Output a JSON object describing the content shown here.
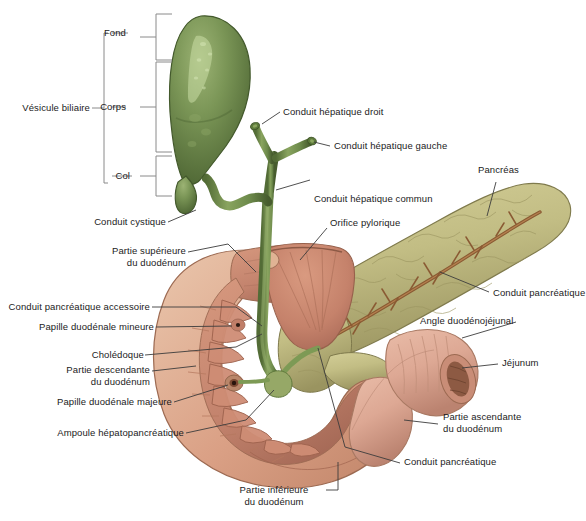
{
  "figure": {
    "language": "fr",
    "background_color": "#ffffff",
    "leader_line_color": "#3c3c3c",
    "bracket_color": "#8a8a8a",
    "text_color": "#1b1b1b"
  },
  "palette": {
    "gallbladder_green": "#6f8b4e",
    "gallbladder_green_dark": "#4d6433",
    "gallbladder_highlight": "#b9cf93",
    "bile_duct_green": "#76914f",
    "bile_duct_dark": "#4f6733",
    "duodenum_outer": "#d79a80",
    "duodenum_wall": "#e8c3a9",
    "duodenum_mucosa": "#c98975",
    "duodenum_mucosa_dark": "#ab6e5c",
    "pancreas": "#c2bd84",
    "pancreas_dark": "#9a9460",
    "pancreas_duct": "#8a5a33",
    "jejunum": "#dda894",
    "jejunum_dark": "#bd846f"
  },
  "brackets": {
    "gallbladder_group_label": "Vésicule biliaire",
    "parts": [
      {
        "label": "Fond"
      },
      {
        "label": "Corps"
      },
      {
        "label": "Col"
      }
    ]
  },
  "labels": [
    {
      "id": "vesicule-biliaire",
      "text": "Vésicule biliaire",
      "align": "right"
    },
    {
      "id": "fond",
      "text": "Fond",
      "align": "right"
    },
    {
      "id": "corps",
      "text": "Corps",
      "align": "right"
    },
    {
      "id": "col",
      "text": "Col",
      "align": "right"
    },
    {
      "id": "conduit-hepatique-droit",
      "text": "Conduit hépatique droit",
      "align": "left"
    },
    {
      "id": "conduit-hepatique-gauche",
      "text": "Conduit hépatique gauche",
      "align": "left"
    },
    {
      "id": "conduit-hepatique-commun",
      "text": "Conduit hépatique commun",
      "align": "left"
    },
    {
      "id": "orifice-pylorique",
      "text": "Orifice pylorique",
      "align": "left"
    },
    {
      "id": "pancreas",
      "text": "Pancréas",
      "align": "left"
    },
    {
      "id": "conduit-pancreatique-droite",
      "text": "Conduit pancréatique",
      "align": "left"
    },
    {
      "id": "angle-duodenojejunal",
      "text": "Angle duodénojéjunal",
      "align": "left"
    },
    {
      "id": "jejunum",
      "text": "Jéjunum",
      "align": "left"
    },
    {
      "id": "partie-ascendante",
      "text": "Partie ascendante\ndu duodénum",
      "align": "left"
    },
    {
      "id": "conduit-pancreatique-bas",
      "text": "Conduit pancréatique",
      "align": "left"
    },
    {
      "id": "conduit-cystique",
      "text": "Conduit cystique",
      "align": "right"
    },
    {
      "id": "partie-superieure",
      "text": "Partie supérieure\ndu duodénum",
      "align": "right"
    },
    {
      "id": "conduit-pancreatique-accessoire",
      "text": "Conduit pancréatique accessoire",
      "align": "right"
    },
    {
      "id": "papille-duodenale-mineure",
      "text": "Papille duodénale mineure",
      "align": "right"
    },
    {
      "id": "choledoque",
      "text": "Cholédoque",
      "align": "right"
    },
    {
      "id": "partie-descendante",
      "text": "Partie descendante\ndu duodénum",
      "align": "right"
    },
    {
      "id": "papille-duodenale-majeure",
      "text": "Papille duodénale majeure",
      "align": "right"
    },
    {
      "id": "ampoule-hepatopancreatique",
      "text": "Ampoule hépatopancréatique",
      "align": "right"
    },
    {
      "id": "partie-inferieure",
      "text": "Partie inférieure\ndu duodénum",
      "align": "center"
    }
  ]
}
